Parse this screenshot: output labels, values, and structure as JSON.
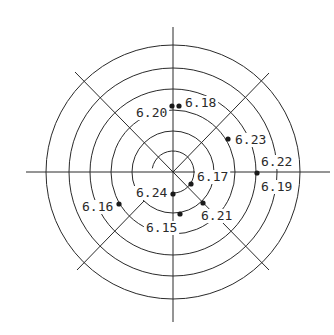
{
  "diagram": {
    "type": "polar-measurement-map",
    "center": [
      173,
      172
    ],
    "rings": [
      {
        "r": 21,
        "arc": "partial"
      },
      {
        "r": 41
      },
      {
        "r": 62
      },
      {
        "r": 83
      },
      {
        "r": 104
      },
      {
        "r": 127
      }
    ],
    "axes": {
      "horizontal": {
        "x1": 26,
        "x2": 330,
        "y": 172
      },
      "vertical": {
        "x": 173,
        "y1": 27,
        "y2": 322
      },
      "diagonals": [
        {
          "name": "upper-left",
          "x1": 75,
          "y1": 72,
          "x2": 173,
          "y2": 172
        },
        {
          "name": "upper-right",
          "x1": 173,
          "y1": 172,
          "x2": 269,
          "y2": 73
        },
        {
          "name": "lower-right",
          "x1": 173,
          "y1": 172,
          "x2": 269,
          "y2": 270
        },
        {
          "name": "lower-left",
          "x1": 144,
          "y1": 201,
          "x2": 77,
          "y2": 270
        }
      ]
    },
    "points": [
      {
        "label": "6.20",
        "dot": [
          172,
          106
        ],
        "text": [
          136,
          117
        ]
      },
      {
        "label": "6.18",
        "dot": [
          179,
          106
        ],
        "text": [
          185,
          107
        ]
      },
      {
        "label": "6.23",
        "dot": [
          228,
          139
        ],
        "text": [
          235,
          144
        ]
      },
      {
        "label": "6.22",
        "dot": [
          257,
          173
        ],
        "text": [
          261,
          166
        ]
      },
      {
        "label": "6.19",
        "dot": null,
        "text": [
          261,
          191
        ]
      },
      {
        "label": "6.17",
        "dot": [
          191,
          184
        ],
        "text": [
          197,
          181
        ]
      },
      {
        "label": "6.24",
        "dot": [
          173,
          194
        ],
        "text": [
          136,
          197
        ]
      },
      {
        "label": "6.21",
        "dot": [
          203,
          203
        ],
        "text": [
          201,
          220
        ]
      },
      {
        "label": "6.15",
        "dot": [
          180,
          214
        ],
        "text": [
          146,
          232
        ]
      },
      {
        "label": "6.16",
        "dot": [
          119,
          204
        ],
        "text": [
          82,
          211
        ]
      }
    ]
  }
}
